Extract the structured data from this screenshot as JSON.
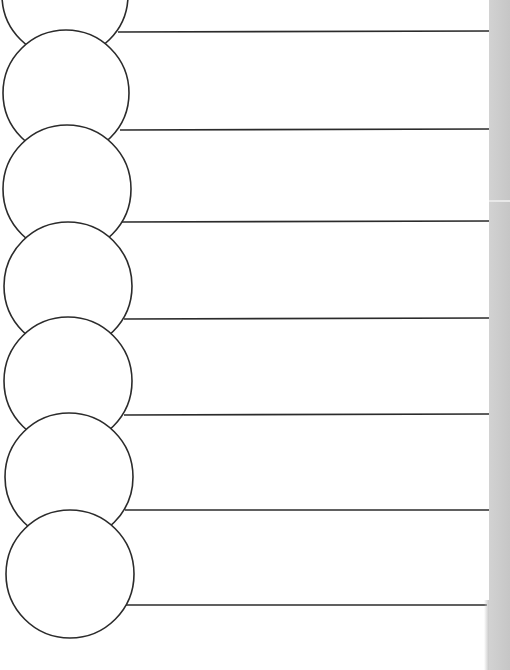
{
  "worksheet": {
    "type": "chain-of-circles graphic organizer",
    "stroke_color": "#2b2b2b",
    "background_color": "#ffffff",
    "edge_strip_color": "#c8c8c8",
    "rows": [
      {
        "index": 1,
        "circle_text": "",
        "line_text": ""
      },
      {
        "index": 2,
        "circle_text": "",
        "line_text": ""
      },
      {
        "index": 3,
        "circle_text": "",
        "line_text": ""
      },
      {
        "index": 4,
        "circle_text": "",
        "line_text": ""
      },
      {
        "index": 5,
        "circle_text": "",
        "line_text": ""
      },
      {
        "index": 6,
        "circle_text": "",
        "line_text": ""
      },
      {
        "index": 7,
        "circle_text": "",
        "line_text": ""
      }
    ]
  }
}
